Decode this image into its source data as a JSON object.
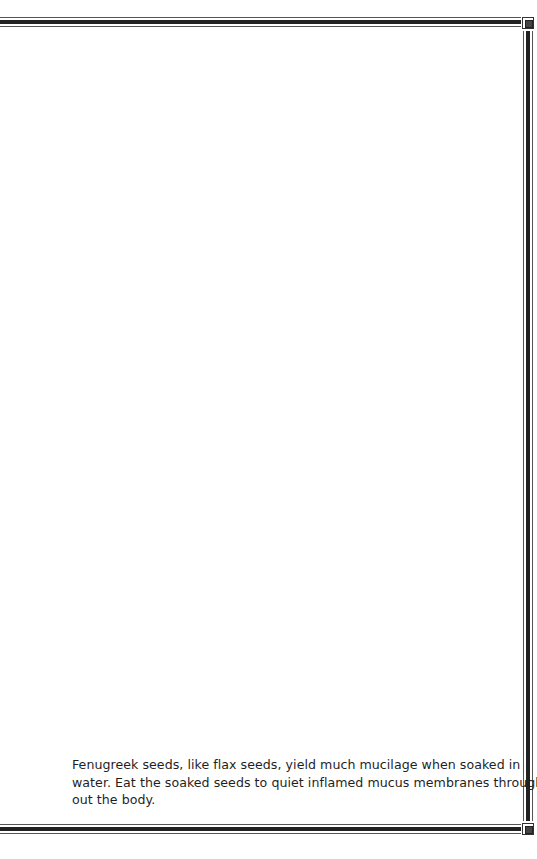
{
  "page": {
    "border": {
      "style": "double-rule frame with corner boxes",
      "color": "#222222"
    },
    "paragraph": {
      "lines": [
        "Fenugreek seeds, like flax seeds, yield much mucilage when soaked in",
        "water. Eat the soaked seeds to quiet inflamed mucus membranes through-",
        "out the body."
      ]
    }
  }
}
